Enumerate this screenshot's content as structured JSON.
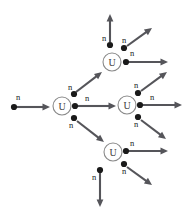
{
  "figure": {
    "background_color": "#ffffff",
    "width": 190,
    "height": 216,
    "colors": {
      "arrow": "#55555a",
      "neutron_dot": "#1a1a1a",
      "nucleus_stroke": "#8a8a8a",
      "nucleus_fill": "#ffffff",
      "label_text": "#1a1a1a",
      "nucleus_text": "#3a3a3a"
    }
  },
  "labels": {
    "nucleus": "U",
    "neutron": "n"
  },
  "nuclei": [
    {
      "id": "u1",
      "label": "U",
      "cx": 62,
      "cy": 106,
      "r": 9
    },
    {
      "id": "u2",
      "label": "U",
      "cx": 112,
      "cy": 62,
      "r": 9
    },
    {
      "id": "u3",
      "label": "U",
      "cx": 127,
      "cy": 105,
      "r": 9
    },
    {
      "id": "u4",
      "label": "U",
      "cx": 113,
      "cy": 152,
      "r": 9
    }
  ],
  "neutrons": [
    {
      "id": "n-incoming",
      "label": "n",
      "dot_x": 14,
      "dot_y": 107,
      "label_x": 18,
      "label_y": 100
    },
    {
      "id": "n-u1-up",
      "label": "n",
      "dot_x": 74,
      "dot_y": 94,
      "label_x": 70,
      "label_y": 90
    },
    {
      "id": "n-u1-right",
      "label": "n",
      "dot_x": 75,
      "dot_y": 106,
      "label_x": 87,
      "label_y": 101
    },
    {
      "id": "n-u1-down",
      "label": "n",
      "dot_x": 74,
      "dot_y": 118,
      "label_x": 71,
      "label_y": 128
    },
    {
      "id": "n-u2-up",
      "label": "n",
      "dot_x": 110,
      "dot_y": 45,
      "label_x": 104,
      "label_y": 41
    },
    {
      "id": "n-u2-diag",
      "label": "n",
      "dot_x": 124,
      "dot_y": 48,
      "label_x": 124,
      "label_y": 43
    },
    {
      "id": "n-u2-right",
      "label": "n",
      "dot_x": 126,
      "dot_y": 62,
      "label_x": 132,
      "label_y": 56
    },
    {
      "id": "n-u3-up",
      "label": "n",
      "dot_x": 138,
      "dot_y": 93,
      "label_x": 136,
      "label_y": 88
    },
    {
      "id": "n-u3-right",
      "label": "n",
      "dot_x": 140,
      "dot_y": 105,
      "label_x": 152,
      "label_y": 100
    },
    {
      "id": "n-u3-down",
      "label": "n",
      "dot_x": 138,
      "dot_y": 117,
      "label_x": 136,
      "label_y": 127
    },
    {
      "id": "n-u4-right",
      "label": "n",
      "dot_x": 126,
      "dot_y": 151,
      "label_x": 132,
      "label_y": 146
    },
    {
      "id": "n-u4-diag",
      "label": "n",
      "dot_x": 124,
      "dot_y": 164,
      "label_x": 124,
      "label_y": 174
    },
    {
      "id": "n-u4-down",
      "label": "n",
      "dot_x": 100,
      "dot_y": 170,
      "label_x": 94,
      "label_y": 180
    }
  ],
  "arrows": [
    {
      "id": "a-incoming",
      "from_neutron": "n-incoming",
      "x1": 16,
      "y1": 107,
      "x2": 50,
      "y2": 107
    },
    {
      "id": "a-u1-to-u2",
      "from_neutron": "n-u1-up",
      "x1": 76,
      "y1": 92,
      "x2": 102,
      "y2": 72
    },
    {
      "id": "a-u1-to-u3",
      "from_neutron": "n-u1-right",
      "x1": 78,
      "y1": 106,
      "x2": 116,
      "y2": 106
    },
    {
      "id": "a-u1-to-u4",
      "from_neutron": "n-u1-down",
      "x1": 77,
      "y1": 121,
      "x2": 104,
      "y2": 142
    },
    {
      "id": "a-u2-up",
      "from_neutron": "n-u2-up",
      "x1": 110,
      "y1": 42,
      "x2": 110,
      "y2": 14
    },
    {
      "id": "a-u2-diag",
      "from_neutron": "n-u2-diag",
      "x1": 127,
      "y1": 46,
      "x2": 152,
      "y2": 28
    },
    {
      "id": "a-u2-right",
      "from_neutron": "n-u2-right",
      "x1": 129,
      "y1": 62,
      "x2": 168,
      "y2": 62
    },
    {
      "id": "a-u3-diag",
      "from_neutron": "n-u3-up",
      "x1": 141,
      "y1": 91,
      "x2": 167,
      "y2": 72
    },
    {
      "id": "a-u3-right",
      "from_neutron": "n-u3-right",
      "x1": 143,
      "y1": 105,
      "x2": 182,
      "y2": 105
    },
    {
      "id": "a-u3-diag2",
      "from_neutron": "n-u3-down",
      "x1": 141,
      "y1": 120,
      "x2": 166,
      "y2": 139
    },
    {
      "id": "a-u4-right",
      "from_neutron": "n-u4-right",
      "x1": 129,
      "y1": 151,
      "x2": 168,
      "y2": 151
    },
    {
      "id": "a-u4-diag",
      "from_neutron": "n-u4-diag",
      "x1": 127,
      "y1": 167,
      "x2": 152,
      "y2": 185
    },
    {
      "id": "a-u4-down",
      "from_neutron": "n-u4-down",
      "x1": 100,
      "y1": 173,
      "x2": 100,
      "y2": 207
    }
  ],
  "chart_data": {
    "type": "diagram",
    "nodes": [
      {
        "id": "u1",
        "label": "U",
        "generation": 1,
        "emitted_neutrons": 3
      },
      {
        "id": "u2",
        "label": "U",
        "generation": 2,
        "emitted_neutrons": 3
      },
      {
        "id": "u3",
        "label": "U",
        "generation": 2,
        "emitted_neutrons": 3
      },
      {
        "id": "u4",
        "label": "U",
        "generation": 2,
        "emitted_neutrons": 3
      }
    ],
    "edges": [
      {
        "from": "incoming",
        "to": "u1",
        "label": "n"
      },
      {
        "from": "u1",
        "to": "u2",
        "label": "n"
      },
      {
        "from": "u1",
        "to": "u3",
        "label": "n"
      },
      {
        "from": "u1",
        "to": "u4",
        "label": "n"
      },
      {
        "from": "u2",
        "to": "free",
        "label": "n"
      },
      {
        "from": "u2",
        "to": "free",
        "label": "n"
      },
      {
        "from": "u2",
        "to": "free",
        "label": "n"
      },
      {
        "from": "u3",
        "to": "free",
        "label": "n"
      },
      {
        "from": "u3",
        "to": "free",
        "label": "n"
      },
      {
        "from": "u3",
        "to": "free",
        "label": "n"
      },
      {
        "from": "u4",
        "to": "free",
        "label": "n"
      },
      {
        "from": "u4",
        "to": "free",
        "label": "n"
      },
      {
        "from": "u4",
        "to": "free",
        "label": "n"
      }
    ],
    "counts": {
      "nuclei": 4,
      "neutrons": 13,
      "arrows": 13
    }
  }
}
